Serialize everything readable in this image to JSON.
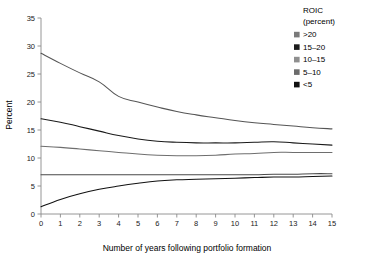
{
  "chart_data": {
    "type": "line",
    "title": "",
    "xlabel": "Number of years following portfolio formation",
    "ylabel": "Percent",
    "xlim": [
      0,
      15
    ],
    "ylim": [
      0,
      35
    ],
    "xticks": [
      0,
      1,
      2,
      3,
      4,
      5,
      6,
      7,
      8,
      9,
      10,
      11,
      12,
      13,
      14,
      15
    ],
    "yticks": [
      0,
      5,
      10,
      15,
      20,
      25,
      30,
      35
    ],
    "xticklabels": [
      "0",
      "1",
      "2",
      "3",
      "4",
      "5",
      "6",
      "7",
      "8",
      "9",
      "10",
      "11",
      "12",
      "13",
      "14",
      "15"
    ],
    "yticklabels": [
      "0",
      "5",
      "10",
      "15",
      "20",
      "25",
      "30",
      "35"
    ],
    "grid": false,
    "legend_position": "top-right",
    "legend_title": "ROIC",
    "legend_subtitle": "(percent)",
    "x": [
      0,
      1,
      2,
      3,
      4,
      5,
      6,
      7,
      8,
      9,
      10,
      11,
      12,
      13,
      14,
      15
    ],
    "series": [
      {
        "name": ">20",
        "swatch_color": "#7a7a7a",
        "line_color": "#555555",
        "values": [
          28.7,
          26.9,
          25.2,
          23.6,
          21.0,
          20.0,
          19.1,
          18.3,
          17.7,
          17.2,
          16.7,
          16.3,
          16.0,
          15.7,
          15.4,
          15.2
        ]
      },
      {
        "name": "15–20",
        "swatch_color": "#1c1c1c",
        "line_color": "#1a1a1a",
        "values": [
          17.0,
          16.4,
          15.6,
          14.8,
          14.0,
          13.4,
          13.0,
          12.8,
          12.7,
          12.7,
          12.7,
          12.8,
          12.9,
          12.7,
          12.5,
          12.3
        ]
      },
      {
        "name": "10–15",
        "swatch_color": "#8f8f8f",
        "line_color": "#6e6e6e",
        "values": [
          12.1,
          11.9,
          11.6,
          11.3,
          11.0,
          10.7,
          10.5,
          10.4,
          10.4,
          10.5,
          10.7,
          10.8,
          11.0,
          11.0,
          11.0,
          11.0
        ]
      },
      {
        "name": "5–10",
        "swatch_color": "#6b6b6b",
        "line_color": "#4a4a4a",
        "values": [
          7.0,
          7.0,
          7.0,
          7.0,
          7.0,
          7.0,
          7.0,
          7.0,
          7.0,
          7.0,
          7.0,
          7.0,
          7.1,
          7.1,
          7.2,
          7.2
        ]
      },
      {
        "name": "<5",
        "swatch_color": "#111111",
        "line_color": "#111111",
        "values": [
          1.3,
          2.6,
          3.6,
          4.4,
          5.0,
          5.5,
          5.9,
          6.1,
          6.2,
          6.3,
          6.4,
          6.5,
          6.6,
          6.6,
          6.7,
          6.8
        ]
      }
    ]
  }
}
